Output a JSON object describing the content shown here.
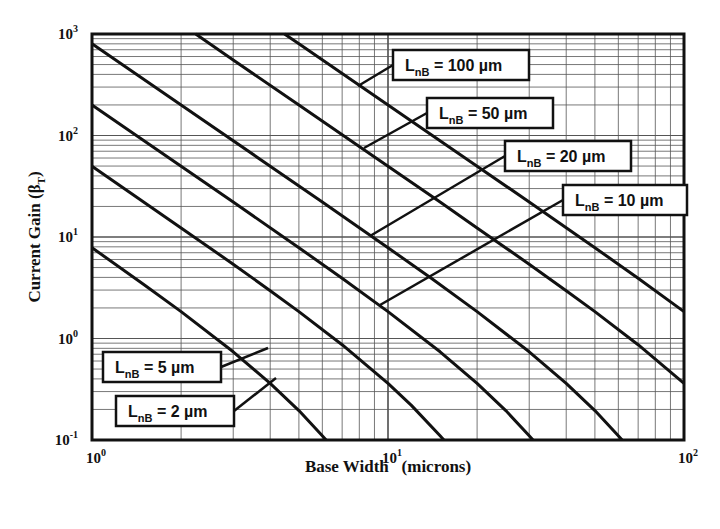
{
  "chart_data": {
    "type": "line",
    "title": "",
    "xlabel": "Base Width   (microns)",
    "ylabel": "Current Gain (βT)",
    "ylabel_main": "Current Gain (β",
    "ylabel_sub": "T",
    "ylabel_close": ")",
    "xscale": "log",
    "yscale": "log",
    "xlim": [
      1,
      100
    ],
    "ylim": [
      0.1,
      1000
    ],
    "grid": true,
    "x_ticks": [
      {
        "base": "10",
        "exp": "0",
        "value": 1
      },
      {
        "base": "10",
        "exp": "1",
        "value": 10
      },
      {
        "base": "10",
        "exp": "2",
        "value": 100
      }
    ],
    "y_ticks": [
      {
        "base": "10",
        "exp": "3",
        "value": 1000
      },
      {
        "base": "10",
        "exp": "2",
        "value": 100
      },
      {
        "base": "10",
        "exp": "1",
        "value": 10
      },
      {
        "base": "10",
        "exp": "0",
        "value": 1
      },
      {
        "base": "10",
        "exp": "-1",
        "value": 0.1
      }
    ],
    "series": [
      {
        "name": "L_nB = 2 µm",
        "label_main": "L",
        "label_sub": "nB",
        "label_rest": " = 2 µm",
        "x": [
          1,
          1.5,
          2,
          3,
          4,
          5,
          6,
          6.18
        ],
        "y": [
          7.84,
          3.39,
          1.84,
          0.739,
          0.362,
          0.195,
          0.11,
          0.1
        ]
      },
      {
        "name": "L_nB = 5 µm",
        "label_main": "L",
        "label_sub": "nB",
        "label_rest": " = 5 µm",
        "x": [
          1,
          2,
          3,
          4,
          5,
          7,
          10,
          12,
          15,
          15.45
        ],
        "y": [
          49.8,
          12.3,
          5.39,
          2.96,
          1.84,
          0.869,
          0.362,
          0.219,
          0.11,
          0.1
        ]
      },
      {
        "name": "L_nB = 10 µm",
        "label_main": "L",
        "label_sub": "nB",
        "label_rest": " = 10 µm",
        "x": [
          1,
          2,
          3,
          5,
          7,
          10,
          15,
          20,
          25,
          30,
          30.9
        ],
        "y": [
          200,
          49.8,
          22.1,
          7.84,
          3.92,
          1.84,
          0.739,
          0.362,
          0.195,
          0.11,
          0.1
        ]
      },
      {
        "name": "L_nB = 20 µm",
        "label_main": "L",
        "label_sub": "nB",
        "label_rest": " = 20 µm",
        "x": [
          1,
          2,
          4,
          6,
          10,
          14,
          20,
          30,
          40,
          50,
          60,
          61.8
        ],
        "y": [
          800,
          200,
          49.8,
          22.1,
          7.84,
          3.92,
          1.84,
          0.739,
          0.362,
          0.195,
          0.11,
          0.1
        ]
      },
      {
        "name": "L_nB = 50 µm",
        "label_main": "L",
        "label_sub": "nB",
        "label_rest": " = 50 µm",
        "x": [
          2.24,
          3,
          5,
          10,
          15,
          20,
          30,
          40,
          50,
          70,
          100
        ],
        "y": [
          1000,
          555,
          200,
          49.8,
          22.1,
          12.3,
          5.39,
          2.96,
          1.84,
          0.869,
          0.362
        ]
      },
      {
        "name": "L_nB = 100 µm",
        "label_main": "L",
        "label_sub": "nB",
        "label_rest": " = 100 µm",
        "x": [
          4.47,
          5,
          10,
          20,
          30,
          50,
          70,
          100
        ],
        "y": [
          1000,
          800,
          200,
          49.8,
          22.1,
          7.84,
          3.92,
          1.84
        ]
      }
    ],
    "annotations": [
      {
        "series": 5,
        "box": [
          393,
          50,
          136,
          30
        ],
        "leader_to": [
          358,
          86
        ]
      },
      {
        "series": 4,
        "box": [
          427,
          98,
          126,
          30
        ],
        "leader_to": [
          364,
          148
        ]
      },
      {
        "series": 3,
        "box": [
          505,
          141,
          126,
          30
        ],
        "leader_to": [
          370,
          236
        ]
      },
      {
        "series": 2,
        "box": [
          563,
          185,
          124,
          30
        ],
        "leader_to": [
          380,
          305
        ]
      },
      {
        "series": 1,
        "box": [
          103,
          352,
          118,
          30
        ],
        "leader_to": [
          268,
          348
        ]
      },
      {
        "series": 0,
        "box": [
          116,
          396,
          118,
          30
        ],
        "leader_to": [
          276,
          378
        ]
      }
    ]
  }
}
